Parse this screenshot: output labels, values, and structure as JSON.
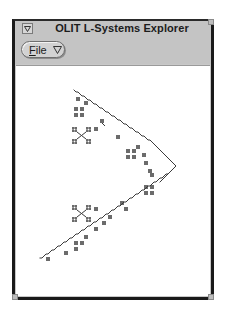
{
  "window": {
    "title": "OLIT L-Systems Explorer",
    "window_menu_icon": "triangle-down-icon"
  },
  "menubar": {
    "items": [
      {
        "label": "File",
        "mnemonic": "F",
        "rest": "ile",
        "icon": "triangle-down-icon"
      }
    ]
  },
  "canvas": {
    "background": "#ffffff",
    "stroke_color": "#3a3a3a",
    "figure": "L-system fractal curve"
  }
}
